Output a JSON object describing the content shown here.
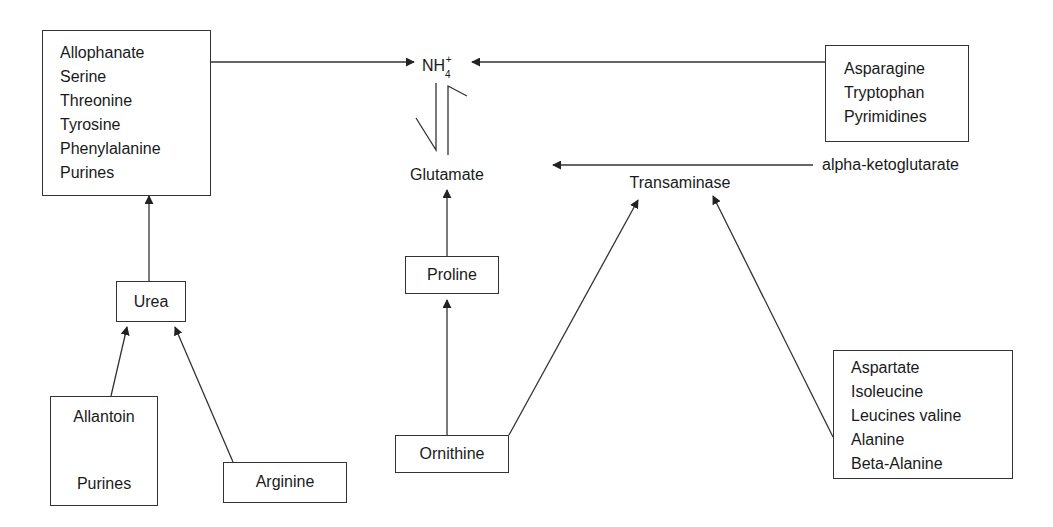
{
  "diagram": {
    "type": "nitrogen-source metabolic pathway",
    "nodes": {
      "left_sources": {
        "items": [
          "Allophanate",
          "Serine",
          "Threonine",
          "Tyrosine",
          "Phenylalanine",
          "Purines"
        ]
      },
      "ammonium": {
        "base": "NH",
        "subscript": "4",
        "superscript": "+"
      },
      "right_sources": {
        "items": [
          "Asparagine",
          "Tryptophan",
          "Pyrimidines"
        ]
      },
      "glutamate": "Glutamate",
      "alpha_ketoglutarate": "alpha-ketoglutarate",
      "transaminase": "Transaminase",
      "urea": "Urea",
      "proline": "Proline",
      "allantoin_box": {
        "top": "Allantoin",
        "bottom": "Purines"
      },
      "arginine": "Arginine",
      "ornithine": "Ornithine",
      "transaminase_sources": {
        "items": [
          "Aspartate",
          "Isoleucine",
          "Leucines valine",
          "Alanine",
          "Beta-Alanine"
        ]
      }
    },
    "edges": [
      {
        "from": "left_sources",
        "to": "ammonium"
      },
      {
        "from": "right_sources",
        "to": "ammonium"
      },
      {
        "from": "ammonium",
        "to": "glutamate",
        "type": "equilibrium"
      },
      {
        "from": "alpha_ketoglutarate",
        "to": "glutamate"
      },
      {
        "from": "proline",
        "to": "glutamate"
      },
      {
        "from": "ornithine",
        "to": "proline"
      },
      {
        "from": "ornithine",
        "to": "transaminase"
      },
      {
        "from": "transaminase_sources",
        "to": "transaminase"
      },
      {
        "from": "urea",
        "to": "left_sources"
      },
      {
        "from": "allantoin_box",
        "to": "urea"
      },
      {
        "from": "arginine",
        "to": "urea"
      },
      {
        "from": "purines",
        "to": "allantoin"
      }
    ],
    "colors": {
      "line": "#333333",
      "text": "#1a1a1a",
      "background": "#ffffff"
    }
  }
}
